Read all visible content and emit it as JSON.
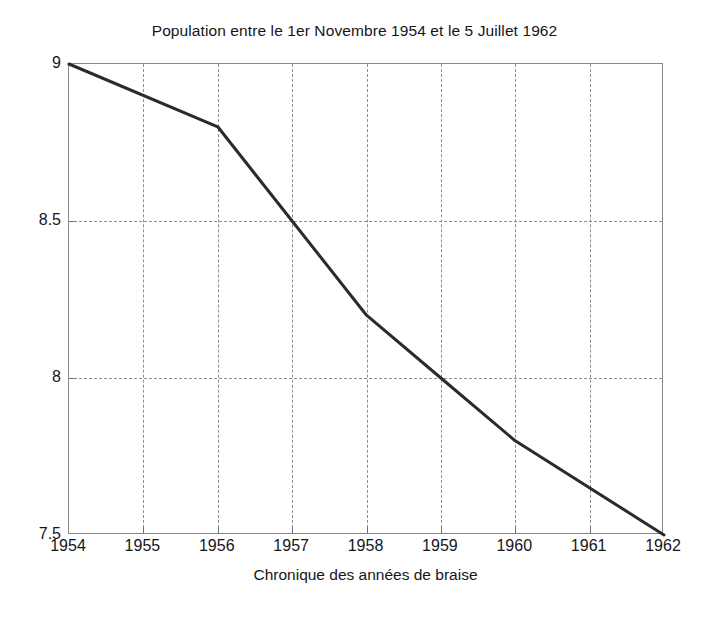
{
  "chart_data": {
    "type": "line",
    "title": "Population entre le 1er Novembre 1954 et le 5 Juillet 1962",
    "xlabel": "Chronique des années de braise",
    "ylabel": "",
    "x": [
      1954,
      1956,
      1957,
      1958,
      1959,
      1960,
      1962
    ],
    "values": [
      9.0,
      8.8,
      8.5,
      8.2,
      8.0,
      7.8,
      7.5
    ],
    "series": [
      {
        "name": "Population",
        "x": [
          1954,
          1956,
          1957,
          1958,
          1959,
          1960,
          1962
        ],
        "values": [
          9.0,
          8.8,
          8.5,
          8.2,
          8.0,
          7.8,
          7.5
        ]
      }
    ],
    "xlim": [
      1954,
      1962
    ],
    "ylim": [
      7.5,
      9.0
    ],
    "xticks": [
      1954,
      1955,
      1956,
      1957,
      1958,
      1959,
      1960,
      1961,
      1962
    ],
    "xtick_labels": [
      "1954",
      "1955",
      "1956",
      "1957",
      "1958",
      "1959",
      "1960",
      "1961",
      "1962"
    ],
    "yticks": [
      7.5,
      8.0,
      8.5,
      9.0
    ],
    "ytick_labels": [
      "7.5",
      "8",
      "8.5",
      "9"
    ],
    "grid": true,
    "grid_style": "dashed",
    "legend": null,
    "line_color": "#2b2b2b",
    "line_width": 3,
    "background": "#ffffff",
    "axis_color": "#878787",
    "grid_color": "#8e8e92"
  }
}
